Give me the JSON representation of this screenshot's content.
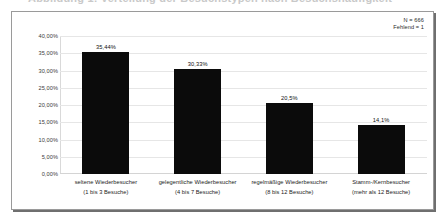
{
  "cut_heading": "Abbildung 1: Verteilung der Besuchstypen nach Besuchshäufigkeit",
  "notes": {
    "n_label": "N = 666",
    "missing_label": "Fehlend = 1"
  },
  "chart_data": {
    "type": "bar",
    "title": "",
    "xlabel": "",
    "ylabel": "",
    "ylim": [
      0,
      40
    ],
    "grid": true,
    "legend": "none",
    "bar_color": "#0b0b0b",
    "ytick_labels": [
      "40,00%",
      "35,00%",
      "30,00%",
      "25,00%",
      "20,00%",
      "15,00%",
      "10,00%",
      "5,00%",
      "0,00%"
    ],
    "ytick_values": [
      40,
      35,
      30,
      25,
      20,
      15,
      10,
      5,
      0
    ],
    "categories": [
      "seltene Wiederbesucher",
      "gelegentliche Wiederbesucher",
      "regelmäßige Wiederbesucher",
      "Stamm-/Kernbesucher"
    ],
    "category_sublabels": [
      "(1 bis 3 Besuche)",
      "(4 bis 7 Besuche)",
      "(8 bis 12 Besuche)",
      "(mehr als 12 Besuche)"
    ],
    "values": [
      35.44,
      30.33,
      20.5,
      14.1
    ],
    "data_labels": [
      "35,44%",
      "30,33%",
      "20,5%",
      "14,1%"
    ]
  }
}
